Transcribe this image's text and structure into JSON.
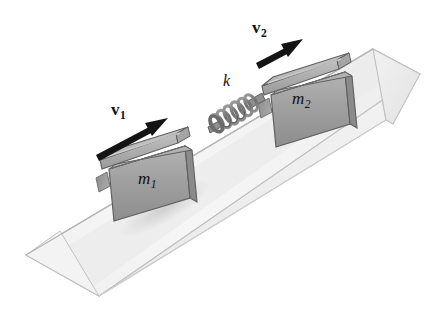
{
  "figure": {
    "width": 444,
    "height": 313,
    "background_color": "#ffffff"
  },
  "labels": {
    "v1": {
      "symbol": "v",
      "subscript": "1",
      "style": "bold-vector"
    },
    "v2": {
      "symbol": "v",
      "subscript": "2",
      "style": "bold-vector"
    },
    "m1": {
      "symbol": "m",
      "subscript": "1",
      "style": "italic"
    },
    "m2": {
      "symbol": "m",
      "subscript": "2",
      "style": "italic"
    },
    "k": {
      "symbol": "k",
      "style": "italic"
    }
  },
  "colors": {
    "ink": "#111111",
    "ramp_top": "#f4f4f4",
    "ramp_top_shade": "#e6e6e6",
    "ramp_side": "#f0f0f0",
    "ramp_end": "#ededed",
    "ramp_outline": "#b9b9b9",
    "block_face": "#9c9c9c",
    "block_face_light": "#bdbdbd",
    "block_top": "#b2b2b2",
    "block_cap": "#b8b8b8",
    "block_cap_top": "#cbcbcb",
    "block_outline": "#5c5c5c",
    "spring_wire": "#808080",
    "spring_wire_dark": "#4f4f4f",
    "shadow": "#d8d8d8"
  },
  "objects": {
    "ramp": {
      "name": "inclined plane",
      "shape": "triangular prism",
      "incline_direction": "up to the right"
    },
    "block1": {
      "name": "block m1",
      "position": "lower-left on ramp"
    },
    "block2": {
      "name": "block m2",
      "position": "upper-right on ramp"
    },
    "spring": {
      "name": "spring k",
      "coils": 6,
      "position": "between the blocks, attached to m2"
    },
    "arrow1": {
      "name": "velocity arrow v1",
      "direction": "up the incline"
    },
    "arrow2": {
      "name": "velocity arrow v2",
      "direction": "up the incline"
    }
  }
}
